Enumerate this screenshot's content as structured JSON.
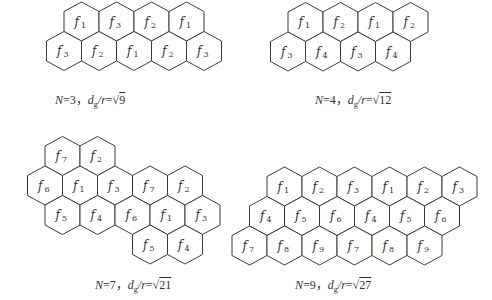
{
  "figure": {
    "hex": {
      "half_width": 17.5,
      "vertical_radius": 19.5,
      "shoulder": 10,
      "stroke": "#3c3c3c",
      "label_color": "#333333"
    },
    "panels": [
      {
        "id": "n3",
        "caption": {
          "N": "3",
          "ratio_value": "9",
          "x": 55,
          "y": 93
        },
        "rows": [
          {
            "cy": 21.5,
            "x0": 81.5,
            "labels": [
              "1",
              "3",
              "2",
              "1"
            ]
          },
          {
            "cy": 51,
            "x0": 64,
            "labels": [
              "3",
              "2",
              "1",
              "2",
              "3"
            ]
          }
        ]
      },
      {
        "id": "n4",
        "caption": {
          "N": "4",
          "ratio_value": "12",
          "x": 315,
          "y": 93
        },
        "rows": [
          {
            "cy": 22,
            "x0": 305.5,
            "labels": [
              "1",
              "2",
              "1",
              "2"
            ]
          },
          {
            "cy": 51.5,
            "x0": 288,
            "labels": [
              "3",
              "4",
              "3",
              "4"
            ]
          }
        ]
      },
      {
        "id": "n7",
        "caption": {
          "N": "7",
          "ratio_value": "21",
          "x": 95,
          "y": 278
        },
        "rows": [
          {
            "cy": 156,
            "x0": 62.5,
            "labels": [
              "7",
              "2"
            ]
          },
          {
            "cy": 185.5,
            "x0": 45,
            "labels": [
              "6",
              "1",
              "3",
              "7",
              "2"
            ]
          },
          {
            "cy": 215,
            "x0": 62.5,
            "labels": [
              "5",
              "4",
              "6",
              "1",
              "3"
            ]
          },
          {
            "cy": 244.5,
            "x0": 150,
            "labels": [
              "5",
              "4"
            ]
          }
        ]
      },
      {
        "id": "n9",
        "caption": {
          "N": "9",
          "ratio_value": "27",
          "x": 295,
          "y": 278
        },
        "rows": [
          {
            "cy": 186.5,
            "x0": 284.5,
            "labels": [
              "1",
              "2",
              "3",
              "1",
              "2",
              "3"
            ]
          },
          {
            "cy": 216,
            "x0": 267,
            "labels": [
              "4",
              "5",
              "6",
              "4",
              "5",
              "6"
            ]
          },
          {
            "cy": 245.5,
            "x0": 249.5,
            "labels": [
              "7",
              "8",
              "9",
              "7",
              "8",
              "9"
            ]
          }
        ]
      }
    ],
    "label_symbol": "f",
    "caption_parts": {
      "N_symbol": "N",
      "equals": "=",
      "separator": "，",
      "d_symbol": "d",
      "d_sub": "g",
      "slash_r": "/r",
      "sqrt": "√"
    }
  }
}
